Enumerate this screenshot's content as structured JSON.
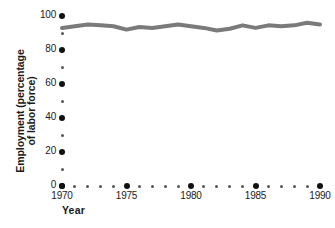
{
  "chart_data": {
    "type": "line",
    "title": "",
    "xlabel": "Year",
    "ylabel": "Employment (percentage of labor force)",
    "ylabel_line1": "Employment (percentage",
    "ylabel_line2": "of labor force)",
    "xlim": [
      1970,
      1990
    ],
    "ylim": [
      0,
      100
    ],
    "grid": false,
    "legend": "none",
    "line_color": "#7a7a7a",
    "line_width_px": 4,
    "axis_tick_color": "#111111",
    "x": [
      1970,
      1971,
      1972,
      1973,
      1974,
      1975,
      1976,
      1977,
      1978,
      1979,
      1980,
      1981,
      1982,
      1983,
      1984,
      1985,
      1986,
      1987,
      1988,
      1989,
      1990
    ],
    "series": [
      {
        "name": "Employment",
        "values": [
          93,
          94,
          95,
          94.5,
          94,
          92,
          93.5,
          93,
          94,
          95,
          94,
          93,
          91.5,
          92.5,
          94.5,
          93,
          94.5,
          94,
          94.5,
          96,
          95
        ]
      }
    ],
    "x_major_ticks": [
      1970,
      1975,
      1980,
      1985,
      1990
    ],
    "x_major_tick_labels": [
      "1970",
      "1975",
      "1980",
      "1985",
      "1990"
    ],
    "x_minor_ticks": [
      1971,
      1972,
      1973,
      1974,
      1976,
      1977,
      1978,
      1979,
      1981,
      1982,
      1983,
      1984,
      1986,
      1987,
      1988,
      1989
    ],
    "y_major_ticks": [
      0,
      20,
      40,
      60,
      80,
      100
    ],
    "y_major_tick_labels": [
      "0",
      "20",
      "40",
      "60",
      "80",
      "100"
    ],
    "y_minor_ticks": [
      10,
      30,
      50,
      70,
      90
    ]
  }
}
